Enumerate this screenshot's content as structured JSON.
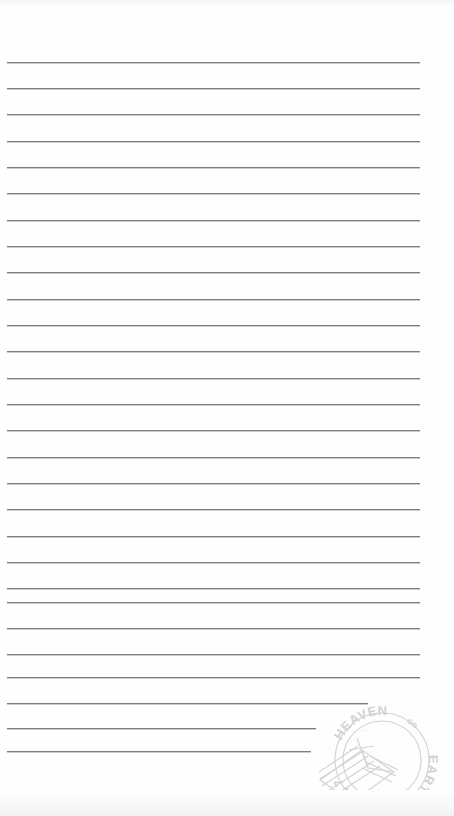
{
  "page": {
    "width": 454,
    "height": 816,
    "background_color": "#fefefe",
    "rule_color": "#7f7f83"
  },
  "ruled_lines": {
    "count": 27,
    "first_y": 62,
    "spacing": 26.5,
    "left_x": 7,
    "default_right_x": 420,
    "lines": [
      {
        "index": 1,
        "y": 62,
        "x1": 7,
        "x2": 420
      },
      {
        "index": 2,
        "y": 88,
        "x1": 7,
        "x2": 420
      },
      {
        "index": 3,
        "y": 114,
        "x1": 7,
        "x2": 420
      },
      {
        "index": 4,
        "y": 141,
        "x1": 7,
        "x2": 420
      },
      {
        "index": 5,
        "y": 167,
        "x1": 7,
        "x2": 420
      },
      {
        "index": 6,
        "y": 193,
        "x1": 7,
        "x2": 420
      },
      {
        "index": 7,
        "y": 220,
        "x1": 7,
        "x2": 420
      },
      {
        "index": 8,
        "y": 246,
        "x1": 7,
        "x2": 420
      },
      {
        "index": 9,
        "y": 272,
        "x1": 7,
        "x2": 420
      },
      {
        "index": 10,
        "y": 299,
        "x1": 7,
        "x2": 420
      },
      {
        "index": 11,
        "y": 325,
        "x1": 7,
        "x2": 420
      },
      {
        "index": 12,
        "y": 351,
        "x1": 7,
        "x2": 420
      },
      {
        "index": 13,
        "y": 378,
        "x1": 7,
        "x2": 420
      },
      {
        "index": 14,
        "y": 404,
        "x1": 7,
        "x2": 420
      },
      {
        "index": 15,
        "y": 430,
        "x1": 7,
        "x2": 420
      },
      {
        "index": 16,
        "y": 457,
        "x1": 7,
        "x2": 420
      },
      {
        "index": 17,
        "y": 483,
        "x1": 7,
        "x2": 420
      },
      {
        "index": 18,
        "y": 509,
        "x1": 7,
        "x2": 420
      },
      {
        "index": 19,
        "y": 536,
        "x1": 7,
        "x2": 420
      },
      {
        "index": 20,
        "y": 562,
        "x1": 7,
        "x2": 420
      },
      {
        "index": 21,
        "y": 588,
        "x1": 7,
        "x2": 420
      },
      {
        "index": 22,
        "y": 602,
        "x1": 7,
        "x2": 420
      },
      {
        "index": 23,
        "y": 628,
        "x1": 7,
        "x2": 420
      },
      {
        "index": 24,
        "y": 654,
        "x1": 7,
        "x2": 420
      },
      {
        "index": 25,
        "y": 677,
        "x1": 7,
        "x2": 420
      },
      {
        "index": 26,
        "y": 703,
        "x1": 7,
        "x2": 368
      },
      {
        "index": 27,
        "y": 728,
        "x1": 7,
        "x2": 316
      },
      {
        "index": 28,
        "y": 751,
        "x1": 7,
        "x2": 311
      }
    ]
  },
  "postmark": {
    "name": "heaven-on-earth-postmark",
    "ring_text_top": "HEAVEN",
    "ring_text_top_small": "on",
    "ring_text_right": "EARTH",
    "ring_text_bottom": "7777",
    "center_text": "·····",
    "color": "#6e6e74",
    "opacity": 0.3,
    "graphic": "tilted-letter-with-speed-lines"
  }
}
